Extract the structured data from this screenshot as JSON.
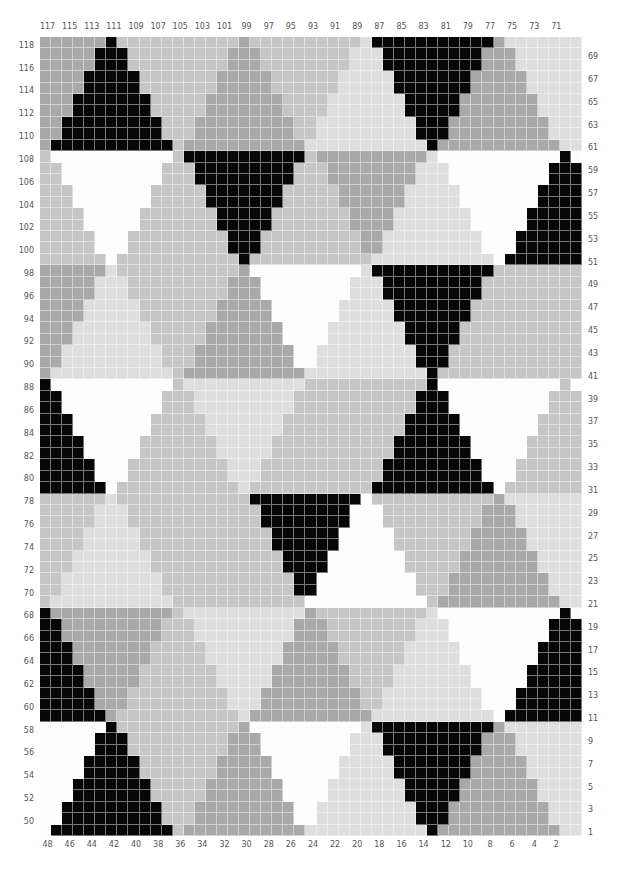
{
  "chart_title": "",
  "grid": {
    "columns": 49,
    "rows": 70,
    "band_rows": 10
  },
  "colors": {
    "K": "#060606",
    "W": "#fdfdfd",
    "L": "#dedede",
    "M": "#c6c6c6",
    "D": "#a9a9a9"
  },
  "top_axis_labels": [
    "117",
    "115",
    "113",
    "111",
    "109",
    "107",
    "105",
    "103",
    "101",
    "99",
    "97",
    "95",
    "93",
    "91",
    "89",
    "87",
    "85",
    "83",
    "81",
    "79",
    "77",
    "75",
    "73",
    "71"
  ],
  "bottom_axis_labels": [
    "48",
    "46",
    "44",
    "42",
    "40",
    "38",
    "36",
    "34",
    "32",
    "30",
    "28",
    "26",
    "24",
    "22",
    "20",
    "18",
    "16",
    "14",
    "12",
    "10",
    "8",
    "6",
    "4",
    "2"
  ],
  "left_axis_labels": [
    "118",
    "116",
    "114",
    "112",
    "110",
    "108",
    "106",
    "104",
    "102",
    "100",
    "98",
    "96",
    "94",
    "92",
    "90",
    "88",
    "86",
    "84",
    "82",
    "80",
    "78",
    "76",
    "74",
    "72",
    "70",
    "68",
    "66",
    "64",
    "62",
    "60",
    "58",
    "56",
    "54",
    "52",
    "50"
  ],
  "right_axis_labels": [
    "69",
    "67",
    "65",
    "63",
    "61",
    "59",
    "57",
    "55",
    "53",
    "51",
    "49",
    "47",
    "45",
    "43",
    "41",
    "39",
    "37",
    "35",
    "33",
    "31",
    "29",
    "27",
    "25",
    "23",
    "21",
    "19",
    "17",
    "15",
    "13",
    "11",
    "9",
    "7",
    "5",
    "3",
    "1"
  ],
  "bands": [
    {
      "up": [
        [
          6,
          "K"
        ],
        [
          18,
          "D"
        ],
        [
          29,
          "L"
        ],
        [
          41,
          "D"
        ]
      ],
      "down": [
        [
          0,
          "D"
        ],
        [
          12,
          "M"
        ],
        [
          24,
          "M"
        ],
        [
          35,
          "K"
        ],
        [
          47,
          "L"
        ]
      ]
    },
    {
      "up": [
        [
          0,
          "M"
        ],
        [
          12,
          "M"
        ],
        [
          24,
          "M"
        ],
        [
          35,
          "L"
        ],
        [
          47,
          "K"
        ]
      ],
      "down": [
        [
          6,
          "W"
        ],
        [
          18,
          "K"
        ],
        [
          29,
          "D"
        ],
        [
          41,
          "W"
        ]
      ]
    },
    {
      "up": [
        [
          6,
          "L"
        ],
        [
          18,
          "D"
        ],
        [
          29,
          "L"
        ],
        [
          41,
          "M"
        ]
      ],
      "down": [
        [
          0,
          "D"
        ],
        [
          12,
          "M"
        ],
        [
          24,
          "W"
        ],
        [
          35,
          "K"
        ],
        [
          47,
          "M"
        ]
      ]
    },
    {
      "up": [
        [
          0,
          "K"
        ],
        [
          12,
          "M"
        ],
        [
          24,
          "M"
        ],
        [
          35,
          "K"
        ],
        [
          47,
          "M"
        ]
      ],
      "down": [
        [
          6,
          "W"
        ],
        [
          18,
          "L"
        ],
        [
          29,
          "M"
        ],
        [
          41,
          "W"
        ]
      ]
    },
    {
      "up": [
        [
          6,
          "L"
        ],
        [
          18,
          "M"
        ],
        [
          29,
          "W"
        ],
        [
          41,
          "D"
        ]
      ],
      "down": [
        [
          0,
          "M"
        ],
        [
          12,
          "M"
        ],
        [
          24,
          "K"
        ],
        [
          35,
          "M"
        ],
        [
          47,
          "L"
        ]
      ]
    },
    {
      "up": [
        [
          0,
          "K"
        ],
        [
          12,
          "M"
        ],
        [
          24,
          "D"
        ],
        [
          35,
          "L"
        ],
        [
          47,
          "K"
        ]
      ],
      "down": [
        [
          6,
          "D"
        ],
        [
          18,
          "L"
        ],
        [
          29,
          "M"
        ],
        [
          41,
          "W"
        ]
      ]
    },
    {
      "up": [
        [
          6,
          "K"
        ],
        [
          18,
          "D"
        ],
        [
          29,
          "L"
        ],
        [
          41,
          "D"
        ]
      ],
      "down": [
        [
          0,
          "W"
        ],
        [
          12,
          "M"
        ],
        [
          24,
          "W"
        ],
        [
          35,
          "K"
        ],
        [
          47,
          "L"
        ]
      ]
    }
  ]
}
